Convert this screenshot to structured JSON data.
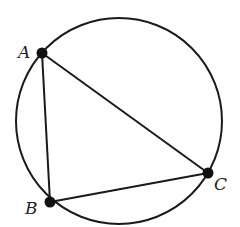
{
  "diagram": {
    "type": "inscribed-triangle",
    "circle": {
      "cx": 119,
      "cy": 121,
      "r": 103
    },
    "stroke_color": "#1a1a1a",
    "point_color": "#111111",
    "points": [
      {
        "id": "A",
        "label": "A",
        "x": 42,
        "y": 53,
        "label_x": 18,
        "label_y": 58
      },
      {
        "id": "B",
        "label": "B",
        "x": 50,
        "y": 202,
        "label_x": 25,
        "label_y": 214
      },
      {
        "id": "C",
        "label": "C",
        "x": 208,
        "y": 173,
        "label_x": 214,
        "label_y": 190
      }
    ],
    "segments": [
      [
        "A",
        "B"
      ],
      [
        "A",
        "C"
      ],
      [
        "B",
        "C"
      ]
    ]
  }
}
